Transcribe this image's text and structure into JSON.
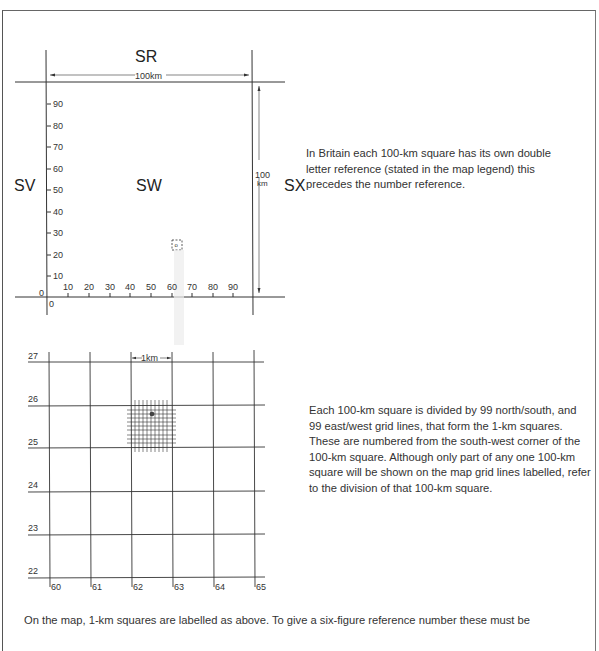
{
  "diagram": {
    "top_panel": {
      "square_labels": {
        "north": "SR",
        "west": "SV",
        "center": "SW",
        "east": "SX"
      },
      "width_label": "100km",
      "height_label_line1": "100",
      "height_label_line2": "km",
      "y_ticks": [
        "90",
        "80",
        "70",
        "60",
        "50",
        "40",
        "30",
        "20",
        "10"
      ],
      "x_ticks": [
        "10",
        "20",
        "30",
        "40",
        "50",
        "60",
        "70",
        "80",
        "90"
      ],
      "origin_y_label": "0",
      "origin_x_label": "0",
      "marker_label": "o"
    },
    "bottom_panel": {
      "scale_label": "1km",
      "northings": [
        "27",
        "26",
        "25",
        "24",
        "23",
        "22"
      ],
      "eastings": [
        "60",
        "61",
        "62",
        "63",
        "64",
        "65"
      ]
    }
  },
  "text": {
    "para1": "In Britain each 100-km square has its own double letter reference (stated in the map legend) this precedes the number reference.",
    "para2": "Each 100-km square is divided by 99 north/south, and 99 east/west grid lines, that form the 1-km squares. These are numbered from the south-west corner of the 100-km square. Although only part of any one 100-km square will be shown on the map grid lines labelled, refer to the division of that 100-km square.",
    "footer": "On the map, 1-km squares are labelled as above.  To give a six-figure reference number these must be"
  }
}
